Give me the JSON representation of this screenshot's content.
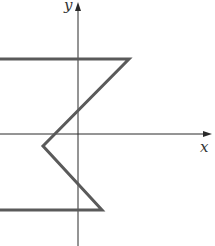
{
  "figure": {
    "type": "function-graph",
    "axes": {
      "x_label": "x",
      "y_label": "y",
      "origin_px": [
        78,
        134
      ],
      "x_axis_end_px": 212,
      "y_axis_top_px": 2
    },
    "curve": {
      "description": "piecewise linear path: horizontal segment at top, diagonal down-left to a left vertex below the x-axis, diagonal down-right, then horizontal segment at bottom",
      "points_px": [
        [
          0,
          59
        ],
        [
          129,
          59
        ],
        [
          43,
          146
        ],
        [
          102,
          210
        ],
        [
          0,
          210
        ]
      ],
      "color": "#5a5a5a"
    },
    "colors": {
      "axis": "#2a2a2a",
      "background": "#ffffff"
    }
  }
}
